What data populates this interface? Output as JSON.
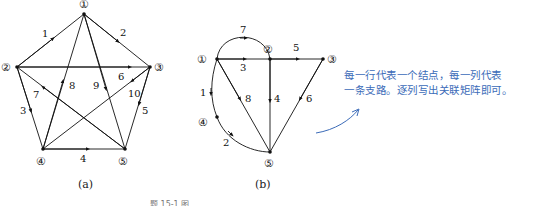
{
  "figure_a": {
    "caption": "(a)",
    "nodes": [
      {
        "id": "1",
        "label": "①",
        "x": 84,
        "y": 14
      },
      {
        "id": "2",
        "label": "②",
        "x": 17,
        "y": 67
      },
      {
        "id": "3",
        "label": "③",
        "x": 150,
        "y": 67
      },
      {
        "id": "4",
        "label": "④",
        "x": 43,
        "y": 149
      },
      {
        "id": "5",
        "label": "⑤",
        "x": 125,
        "y": 149
      }
    ],
    "edges": [
      {
        "label": "1",
        "from": "2",
        "to": "1"
      },
      {
        "label": "2",
        "from": "1",
        "to": "3"
      },
      {
        "label": "3",
        "from": "2",
        "to": "4"
      },
      {
        "label": "4",
        "from": "4",
        "to": "5"
      },
      {
        "label": "5",
        "from": "3",
        "to": "5"
      },
      {
        "label": "6",
        "from": "2",
        "to": "3"
      },
      {
        "label": "7",
        "from": "5",
        "to": "2"
      },
      {
        "label": "8",
        "from": "4",
        "to": "1"
      },
      {
        "label": "9",
        "from": "1",
        "to": "5"
      },
      {
        "label": "10",
        "from": "3",
        "to": "4"
      }
    ]
  },
  "figure_b": {
    "caption": "(b)",
    "nodes": [
      {
        "id": "1",
        "label": "①",
        "x": 217,
        "y": 59
      },
      {
        "id": "2",
        "label": "②",
        "x": 270,
        "y": 59
      },
      {
        "id": "3",
        "label": "③",
        "x": 323,
        "y": 59
      },
      {
        "id": "4",
        "label": "④",
        "x": 217,
        "y": 117
      },
      {
        "id": "5",
        "label": "⑤",
        "x": 270,
        "y": 152
      }
    ],
    "edges": [
      {
        "label": "1",
        "from": "1",
        "to": "4"
      },
      {
        "label": "2",
        "from": "4",
        "to": "5"
      },
      {
        "label": "3",
        "from": "1",
        "to": "2"
      },
      {
        "label": "4",
        "from": "2",
        "to": "5"
      },
      {
        "label": "5",
        "from": "2",
        "to": "3"
      },
      {
        "label": "6",
        "from": "3",
        "to": "5"
      },
      {
        "label": "7",
        "from": "1",
        "to": "2"
      },
      {
        "label": "8",
        "from": "1",
        "to": "5"
      }
    ]
  },
  "annotation": {
    "line1": "每一行代表一个结点，每一列代表",
    "line2": "一条支路。逐列写出关联矩阵即可。",
    "color": "#3b6bb8"
  },
  "figure_caption": "题 15-1 图"
}
